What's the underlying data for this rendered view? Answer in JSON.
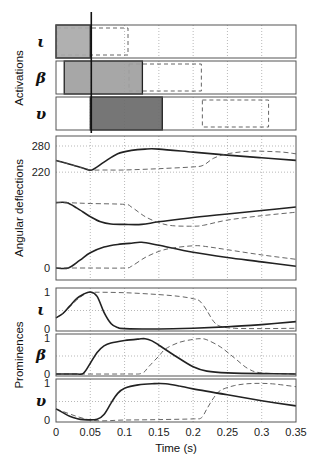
{
  "figure": {
    "xlabel": "Time (s)",
    "x_ticks": [
      "0",
      "0.05",
      "0.1",
      "0.15",
      "0.2",
      "0.25",
      "0.3",
      "0.35"
    ],
    "group_labels": {
      "activations": "Activations",
      "angular": "Angular deflections",
      "prominences": "Prominences"
    },
    "row_symbols": [
      "ι",
      "β",
      "υ"
    ],
    "colors": {
      "frame": "#555555",
      "grid": "#9a9a9a",
      "solid_line": "#222222",
      "dashed_line": "#555555",
      "bar_light": "#a9a9a9",
      "bar_medium": "#a0a0a0",
      "bar_dark": "#6a6a6a",
      "marker_line": "#111111"
    }
  },
  "chart_data": [
    {
      "type": "bar",
      "title": "Activations",
      "xlabel": "Time (s)",
      "xlim": [
        0,
        0.35
      ],
      "grid": true,
      "marker_time": 0.05,
      "rows": [
        {
          "label": "ι",
          "solid": [
            0.0,
            0.05
          ],
          "dashed": [
            0.0,
            0.105
          ],
          "fill": "#a9a9a9"
        },
        {
          "label": "β",
          "solid": [
            0.012,
            0.126
          ],
          "dashed": [
            0.105,
            0.212
          ],
          "fill": "#a0a0a0"
        },
        {
          "label": "υ",
          "solid": [
            0.05,
            0.155
          ],
          "dashed": [
            0.212,
            0.31
          ],
          "fill": "#6a6a6a"
        }
      ]
    },
    {
      "type": "line",
      "title": "Angular deflections",
      "ylabel": "Angular deflections",
      "xlim": [
        0,
        0.35
      ],
      "ylim": [
        -20,
        300
      ],
      "yticks": [
        0,
        220,
        280
      ],
      "grid": true,
      "series": [
        {
          "name": "upper solid",
          "style": "solid",
          "x": [
            0,
            0.02,
            0.04,
            0.052,
            0.07,
            0.09,
            0.11,
            0.13,
            0.15,
            0.2,
            0.25,
            0.3,
            0.35
          ],
          "y": [
            247,
            238,
            229,
            225,
            243,
            262,
            270,
            273,
            273,
            266,
            259,
            253,
            247
          ]
        },
        {
          "name": "upper dashed",
          "style": "dashed",
          "x": [
            0,
            0.02,
            0.04,
            0.052,
            0.07,
            0.1,
            0.15,
            0.2,
            0.215,
            0.23,
            0.25,
            0.28,
            0.3,
            0.33,
            0.35
          ],
          "y": [
            247,
            238,
            229,
            225,
            225,
            225,
            228,
            232,
            236,
            252,
            262,
            268,
            268,
            266,
            262
          ]
        },
        {
          "name": "middle solid",
          "style": "solid",
          "x": [
            0,
            0.015,
            0.03,
            0.05,
            0.065,
            0.08,
            0.1,
            0.125,
            0.15,
            0.2,
            0.25,
            0.3,
            0.35
          ],
          "y": [
            150,
            150,
            138,
            118,
            106,
            101,
            100,
            100,
            106,
            116,
            124,
            132,
            140
          ]
        },
        {
          "name": "middle dashed",
          "style": "dashed",
          "x": [
            0,
            0.015,
            0.05,
            0.1,
            0.11,
            0.13,
            0.15,
            0.17,
            0.2,
            0.215,
            0.25,
            0.3,
            0.35
          ],
          "y": [
            150,
            150,
            148,
            146,
            140,
            118,
            104,
            97,
            96,
            98,
            110,
            120,
            128
          ]
        },
        {
          "name": "lower solid",
          "style": "solid",
          "x": [
            0,
            0.018,
            0.035,
            0.05,
            0.07,
            0.09,
            0.11,
            0.125,
            0.15,
            0.2,
            0.25,
            0.3,
            0.35
          ],
          "y": [
            0,
            0,
            18,
            35,
            48,
            54,
            57,
            59,
            52,
            36,
            24,
            14,
            4
          ]
        },
        {
          "name": "lower dashed",
          "style": "dashed",
          "x": [
            0,
            0.05,
            0.1,
            0.11,
            0.13,
            0.15,
            0.17,
            0.2,
            0.215,
            0.25,
            0.3,
            0.35
          ],
          "y": [
            0,
            0,
            0,
            4,
            24,
            38,
            46,
            51,
            50,
            42,
            30,
            20
          ]
        }
      ]
    },
    {
      "type": "line",
      "title": "Prominence ι",
      "ylabel": "ι",
      "xlim": [
        0,
        0.35
      ],
      "ylim": [
        0,
        1
      ],
      "yticks": [
        0,
        1
      ],
      "grid": true,
      "series": [
        {
          "name": "solid",
          "style": "solid",
          "x": [
            0,
            0.01,
            0.02,
            0.03,
            0.04,
            0.05,
            0.06,
            0.07,
            0.08,
            0.09,
            0.1,
            0.15,
            0.2,
            0.25,
            0.3,
            0.35
          ],
          "y": [
            0.3,
            0.42,
            0.62,
            0.82,
            0.94,
            1.0,
            0.88,
            0.45,
            0.15,
            0.04,
            0.01,
            0.0,
            0.02,
            0.06,
            0.12,
            0.2
          ]
        },
        {
          "name": "dashed",
          "style": "dashed",
          "x": [
            0,
            0.01,
            0.02,
            0.03,
            0.04,
            0.05,
            0.1,
            0.15,
            0.18,
            0.2,
            0.21,
            0.22,
            0.23,
            0.24,
            0.26,
            0.3,
            0.35
          ],
          "y": [
            0.3,
            0.42,
            0.6,
            0.78,
            0.92,
            0.99,
            0.98,
            0.93,
            0.88,
            0.82,
            0.75,
            0.5,
            0.2,
            0.07,
            0.02,
            0.01,
            0.02
          ]
        }
      ]
    },
    {
      "type": "line",
      "title": "Prominence β",
      "ylabel": "β",
      "xlim": [
        0,
        0.35
      ],
      "ylim": [
        0,
        1
      ],
      "yticks": [
        0,
        1
      ],
      "grid": true,
      "series": [
        {
          "name": "solid",
          "style": "solid",
          "x": [
            0,
            0.03,
            0.04,
            0.05,
            0.06,
            0.07,
            0.08,
            0.1,
            0.12,
            0.13,
            0.14,
            0.15,
            0.17,
            0.2,
            0.22,
            0.25,
            0.3,
            0.35
          ],
          "y": [
            0,
            0,
            0.02,
            0.3,
            0.6,
            0.78,
            0.86,
            0.93,
            0.97,
            0.98,
            0.92,
            0.8,
            0.55,
            0.2,
            0.08,
            0.03,
            0.01,
            0.0
          ]
        },
        {
          "name": "dashed",
          "style": "dashed",
          "x": [
            0,
            0.1,
            0.125,
            0.135,
            0.15,
            0.16,
            0.18,
            0.2,
            0.21,
            0.22,
            0.24,
            0.26,
            0.28,
            0.3,
            0.35
          ],
          "y": [
            0,
            0,
            0.02,
            0.2,
            0.5,
            0.7,
            0.88,
            0.96,
            0.98,
            0.95,
            0.75,
            0.45,
            0.15,
            0.03,
            0.0
          ]
        }
      ]
    },
    {
      "type": "line",
      "title": "Prominence υ",
      "ylabel": "υ",
      "xlim": [
        0,
        0.35
      ],
      "ylim": [
        0,
        1
      ],
      "yticks": [
        0,
        1
      ],
      "grid": true,
      "series": [
        {
          "name": "solid",
          "style": "solid",
          "x": [
            0,
            0.01,
            0.02,
            0.03,
            0.04,
            0.06,
            0.07,
            0.08,
            0.09,
            0.1,
            0.12,
            0.14,
            0.16,
            0.18,
            0.2,
            0.25,
            0.3,
            0.35
          ],
          "y": [
            0.3,
            0.2,
            0.1,
            0.04,
            0.01,
            0.02,
            0.15,
            0.45,
            0.72,
            0.86,
            0.95,
            0.98,
            0.98,
            0.92,
            0.84,
            0.68,
            0.52,
            0.38
          ]
        },
        {
          "name": "dashed",
          "style": "dashed",
          "x": [
            0,
            0.05,
            0.1,
            0.15,
            0.2,
            0.212,
            0.22,
            0.23,
            0.24,
            0.26,
            0.28,
            0.3,
            0.32,
            0.35
          ],
          "y": [
            0.3,
            0.0,
            0.0,
            0.01,
            0.03,
            0.06,
            0.3,
            0.6,
            0.8,
            0.93,
            0.98,
            0.99,
            0.97,
            0.9
          ]
        }
      ]
    }
  ]
}
